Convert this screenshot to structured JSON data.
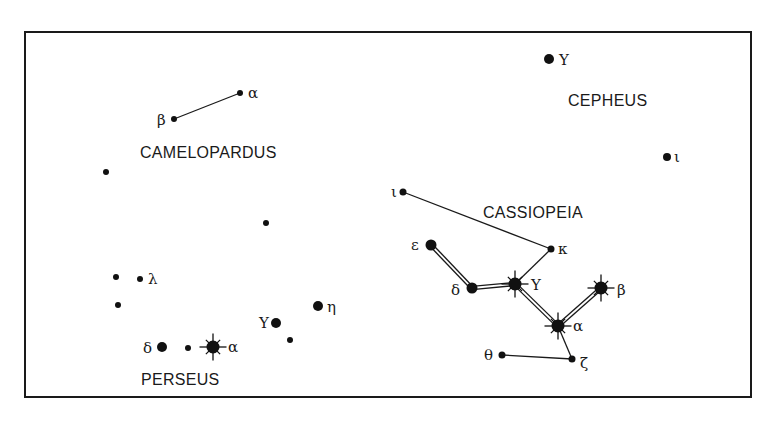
{
  "diagram": {
    "frame": {
      "x": 25,
      "y": 32,
      "width": 726,
      "height": 365
    },
    "colors": {
      "ink": "#1a1a1a",
      "background": "#ffffff"
    },
    "constellation_labels": [
      {
        "text": "CAMELOPARDUS",
        "x": 140,
        "y": 158
      },
      {
        "text": "CEPHEUS",
        "x": 568,
        "y": 106
      },
      {
        "text": "CASSIOPEIA",
        "x": 483,
        "y": 218
      },
      {
        "text": "PERSEUS",
        "x": 141,
        "y": 385
      }
    ],
    "stars": [
      {
        "id": "cam-alpha",
        "constellation": "Camelopardus",
        "label": "α",
        "x": 240,
        "y": 93,
        "r": 3,
        "bright": false,
        "lx": 248,
        "ly": 98
      },
      {
        "id": "cam-beta",
        "constellation": "Camelopardus",
        "label": "β",
        "x": 174,
        "y": 119,
        "r": 3,
        "bright": false,
        "lx": 157,
        "ly": 125
      },
      {
        "id": "field-1",
        "constellation": "",
        "label": "",
        "x": 106,
        "y": 172,
        "r": 3,
        "bright": false
      },
      {
        "id": "field-2",
        "constellation": "",
        "label": "",
        "x": 266,
        "y": 223,
        "r": 3,
        "bright": false
      },
      {
        "id": "cep-gamma",
        "constellation": "Cepheus",
        "label": "Y",
        "x": 549,
        "y": 59,
        "r": 5,
        "bright": false,
        "lx": 559,
        "ly": 65
      },
      {
        "id": "cep-iota",
        "constellation": "Cepheus",
        "label": "ι",
        "x": 667,
        "y": 157,
        "r": 4,
        "bright": false,
        "lx": 674,
        "ly": 162
      },
      {
        "id": "cas-iota",
        "constellation": "Cassiopeia",
        "label": "ι",
        "x": 403,
        "y": 192,
        "r": 3.5,
        "bright": false,
        "lx": 391,
        "ly": 197
      },
      {
        "id": "cas-kappa",
        "constellation": "Cassiopeia",
        "label": "κ",
        "x": 551,
        "y": 249,
        "r": 3.5,
        "bright": false,
        "lx": 558,
        "ly": 254
      },
      {
        "id": "cas-epsilon",
        "constellation": "Cassiopeia",
        "label": "ε",
        "x": 431,
        "y": 245,
        "r": 5.5,
        "bright": false,
        "lx": 411,
        "ly": 250
      },
      {
        "id": "cas-delta",
        "constellation": "Cassiopeia",
        "label": "δ",
        "x": 472,
        "y": 288,
        "r": 5.5,
        "bright": false,
        "lx": 451,
        "ly": 295
      },
      {
        "id": "cas-gamma",
        "constellation": "Cassiopeia",
        "label": "Y",
        "x": 515,
        "y": 284,
        "r": 6.5,
        "bright": true,
        "lx": 531,
        "ly": 290
      },
      {
        "id": "cas-beta",
        "constellation": "Cassiopeia",
        "label": "β",
        "x": 601,
        "y": 288,
        "r": 6.5,
        "bright": true,
        "lx": 617,
        "ly": 295
      },
      {
        "id": "cas-alpha",
        "constellation": "Cassiopeia",
        "label": "α",
        "x": 558,
        "y": 326,
        "r": 6.5,
        "bright": true,
        "lx": 573,
        "ly": 331
      },
      {
        "id": "cas-zeta",
        "constellation": "Cassiopeia",
        "label": "ζ",
        "x": 572,
        "y": 359,
        "r": 3.5,
        "bright": false,
        "lx": 580,
        "ly": 368
      },
      {
        "id": "cas-theta",
        "constellation": "Cassiopeia",
        "label": "θ",
        "x": 502,
        "y": 355,
        "r": 3.5,
        "bright": false,
        "lx": 484,
        "ly": 360
      },
      {
        "id": "per-lambda-a",
        "constellation": "Perseus",
        "label": "",
        "x": 116,
        "y": 277,
        "r": 3,
        "bright": false
      },
      {
        "id": "per-lambda",
        "constellation": "Perseus",
        "label": "λ",
        "x": 140,
        "y": 279,
        "r": 3,
        "bright": false,
        "lx": 148,
        "ly": 284
      },
      {
        "id": "per-field-3",
        "constellation": "Perseus",
        "label": "",
        "x": 118,
        "y": 305,
        "r": 3,
        "bright": false
      },
      {
        "id": "per-eta",
        "constellation": "Perseus",
        "label": "η",
        "x": 318,
        "y": 306,
        "r": 5,
        "bright": false,
        "lx": 327,
        "ly": 312
      },
      {
        "id": "per-gamma",
        "constellation": "Perseus",
        "label": "Y",
        "x": 276,
        "y": 323,
        "r": 5,
        "bright": false,
        "lx": 259,
        "ly": 328
      },
      {
        "id": "per-field-4",
        "constellation": "Perseus",
        "label": "",
        "x": 290,
        "y": 340,
        "r": 3,
        "bright": false
      },
      {
        "id": "per-delta",
        "constellation": "Perseus",
        "label": "δ",
        "x": 162,
        "y": 347,
        "r": 5,
        "bright": false,
        "lx": 143,
        "ly": 353
      },
      {
        "id": "per-field-5",
        "constellation": "Perseus",
        "label": "",
        "x": 188,
        "y": 348,
        "r": 3,
        "bright": false
      },
      {
        "id": "per-alpha",
        "constellation": "Perseus",
        "label": "α",
        "x": 213,
        "y": 347,
        "r": 6.5,
        "bright": true,
        "lx": 228,
        "ly": 352
      }
    ],
    "lines": [
      {
        "from": "cam-beta",
        "to": "cam-alpha",
        "style": "single"
      },
      {
        "from": "cas-iota",
        "to": "cas-kappa",
        "style": "single"
      },
      {
        "from": "cas-kappa",
        "to": "cas-gamma",
        "style": "single"
      },
      {
        "from": "cas-alpha",
        "to": "cas-zeta",
        "style": "single"
      },
      {
        "from": "cas-zeta",
        "to": "cas-theta",
        "style": "single"
      },
      {
        "from": "cas-epsilon",
        "to": "cas-delta",
        "style": "double"
      },
      {
        "from": "cas-delta",
        "to": "cas-gamma",
        "style": "double"
      },
      {
        "from": "cas-gamma",
        "to": "cas-alpha",
        "style": "double"
      },
      {
        "from": "cas-alpha",
        "to": "cas-beta",
        "style": "double"
      }
    ]
  }
}
